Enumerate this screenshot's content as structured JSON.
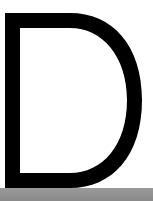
{
  "letter": {
    "character": "D",
    "fill_color": "#000000",
    "background_color": "#ffffff"
  },
  "floor": {
    "color": "#929292"
  }
}
